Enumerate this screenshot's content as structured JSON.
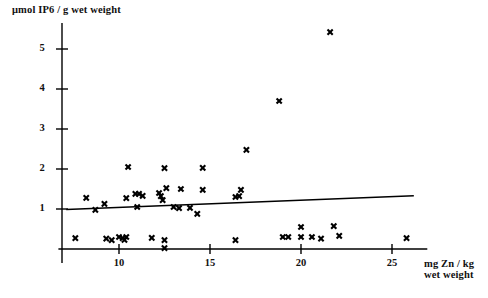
{
  "figure": {
    "title": "",
    "y_axis_label": "μmol IP6 / g wet weight",
    "x_axis_label_line1": "mg Zn / kg",
    "x_axis_label_line2": "wet weight"
  },
  "chart_data": {
    "type": "scatter",
    "title": "",
    "xlabel": "mg Zn / kg wet weight",
    "ylabel": "μmol IP6 / g wet weight",
    "xlim": [
      7.0,
      26.5
    ],
    "ylim": [
      -0.3,
      5.8
    ],
    "xticks": [
      10,
      15,
      20,
      25
    ],
    "yticks": [
      1,
      2,
      3,
      4,
      5
    ],
    "xticklabels": [
      "10",
      "15",
      "20",
      "25"
    ],
    "yticklabels": [
      "1",
      "2",
      "3",
      "4",
      "5"
    ],
    "grid": false,
    "legend": null,
    "marker": "x",
    "marker_color": "#000000",
    "series": [
      {
        "name": "IP6 vs Zn",
        "points": [
          [
            7.6,
            0.27
          ],
          [
            8.2,
            1.28
          ],
          [
            8.7,
            0.98
          ],
          [
            9.2,
            1.13
          ],
          [
            9.3,
            0.26
          ],
          [
            9.6,
            0.22
          ],
          [
            10.0,
            0.3
          ],
          [
            10.2,
            0.27
          ],
          [
            10.3,
            0.23
          ],
          [
            10.4,
            1.27
          ],
          [
            10.5,
            2.05
          ],
          [
            10.4,
            0.3
          ],
          [
            10.9,
            1.38
          ],
          [
            11.1,
            1.38
          ],
          [
            11.0,
            1.05
          ],
          [
            11.3,
            1.33
          ],
          [
            11.8,
            0.28
          ],
          [
            12.2,
            1.4
          ],
          [
            12.3,
            1.32
          ],
          [
            12.5,
            2.02
          ],
          [
            12.4,
            1.22
          ],
          [
            12.6,
            1.52
          ],
          [
            12.5,
            0.22
          ],
          [
            12.5,
            0.02
          ],
          [
            13.0,
            1.05
          ],
          [
            13.3,
            1.02
          ],
          [
            13.4,
            1.5
          ],
          [
            13.9,
            1.03
          ],
          [
            14.3,
            0.88
          ],
          [
            14.6,
            2.03
          ],
          [
            14.6,
            1.48
          ],
          [
            16.4,
            1.3
          ],
          [
            16.6,
            1.32
          ],
          [
            16.7,
            1.48
          ],
          [
            16.4,
            0.22
          ],
          [
            17.0,
            2.48
          ],
          [
            18.8,
            3.7
          ],
          [
            19.0,
            0.3
          ],
          [
            19.3,
            0.3
          ],
          [
            20.0,
            0.55
          ],
          [
            20.0,
            0.3
          ],
          [
            20.6,
            0.3
          ],
          [
            21.1,
            0.26
          ],
          [
            21.6,
            5.42
          ],
          [
            21.8,
            0.57
          ],
          [
            22.1,
            0.33
          ],
          [
            25.8,
            0.27
          ]
        ]
      }
    ],
    "trendline": {
      "name": "regression-line",
      "x": [
        7.1,
        26.2
      ],
      "y": [
        0.99,
        1.33
      ],
      "color": "#000000"
    }
  }
}
